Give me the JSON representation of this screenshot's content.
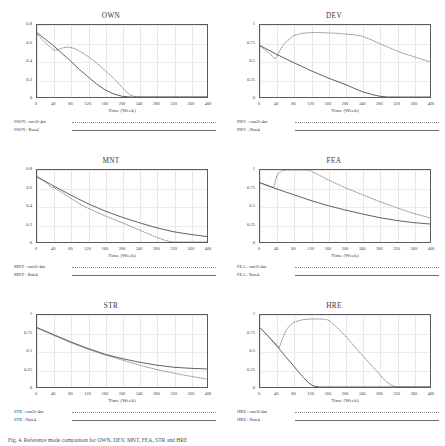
{
  "figure": {
    "caption": "Fig. 4. Reference mode comparison for OWN, DEV, MNT, FEA, STR and HRE",
    "xlabel": "Time (Week)",
    "xticks": [
      "0",
      "40",
      "80",
      "120",
      "160",
      "200",
      "240",
      "280",
      "320",
      "360",
      "400"
    ],
    "series_style": {
      "dotted_color": "#8a8a90",
      "solid_color": "#58585e",
      "frame_color": "#5a5a60",
      "grid_color": "#e9e6e3"
    }
  },
  "chart_data": [
    {
      "type": "line",
      "title": "OWN",
      "xlabel": "Time (Week)",
      "ylabel": "",
      "xlim": [
        0,
        400
      ],
      "ylim": [
        0,
        0.8
      ],
      "xticks": [
        0,
        40,
        80,
        120,
        160,
        200,
        240,
        280,
        320,
        360,
        400
      ],
      "yticks": [
        "0",
        "0.2",
        "0.4",
        "0.6",
        "0.8"
      ],
      "grid": true,
      "legend_position": "below",
      "series": [
        {
          "name": "OWN : run3f-4m",
          "style": "dotted",
          "x": [
            0,
            20,
            40,
            50,
            60,
            70,
            80,
            90,
            100,
            120,
            140,
            160,
            180,
            200,
            210,
            220,
            230,
            240,
            280,
            320,
            360,
            400
          ],
          "y": [
            0.7,
            0.6,
            0.52,
            0.525,
            0.545,
            0.555,
            0.55,
            0.535,
            0.51,
            0.45,
            0.38,
            0.295,
            0.21,
            0.11,
            0.06,
            0.02,
            0.005,
            0.0,
            0.0,
            0.0,
            0.0,
            0.0
          ]
        },
        {
          "name": "OWN : Run4",
          "style": "solid",
          "x": [
            0,
            20,
            40,
            60,
            80,
            100,
            120,
            140,
            160,
            180,
            200,
            220,
            240,
            280,
            320,
            360,
            400
          ],
          "y": [
            0.715,
            0.64,
            0.565,
            0.48,
            0.395,
            0.305,
            0.225,
            0.145,
            0.08,
            0.035,
            0.008,
            0.0,
            0.0,
            0.0,
            0.0,
            0.0,
            0.0
          ]
        }
      ]
    },
    {
      "type": "line",
      "title": "DEV",
      "xlabel": "Time (Week)",
      "ylabel": "",
      "xlim": [
        0,
        400
      ],
      "ylim": [
        0,
        1
      ],
      "xticks": [
        0,
        40,
        80,
        120,
        160,
        200,
        240,
        280,
        320,
        360,
        400
      ],
      "yticks": [
        "0",
        "0.25",
        "0.5",
        "0.75",
        "1"
      ],
      "grid": true,
      "legend_position": "below",
      "series": [
        {
          "name": "DEV : run3f-4m",
          "style": "dotted",
          "x": [
            0,
            20,
            35,
            40,
            50,
            60,
            80,
            100,
            120,
            140,
            160,
            180,
            200,
            220,
            240,
            260,
            280,
            300,
            320,
            340,
            360,
            380,
            400
          ],
          "y": [
            0.71,
            0.62,
            0.53,
            0.565,
            0.68,
            0.76,
            0.855,
            0.885,
            0.895,
            0.895,
            0.89,
            0.885,
            0.875,
            0.865,
            0.845,
            0.8,
            0.745,
            0.695,
            0.645,
            0.6,
            0.565,
            0.525,
            0.49
          ]
        },
        {
          "name": "DEV : Run4",
          "style": "solid",
          "x": [
            0,
            40,
            80,
            120,
            160,
            200,
            240,
            260,
            280,
            300,
            320,
            360,
            400
          ],
          "y": [
            0.715,
            0.59,
            0.475,
            0.365,
            0.265,
            0.175,
            0.075,
            0.04,
            0.012,
            0.0,
            0.0,
            0.0,
            0.0
          ]
        }
      ]
    },
    {
      "type": "line",
      "title": "MNT",
      "xlabel": "Time (Week)",
      "ylabel": "",
      "xlim": [
        0,
        400
      ],
      "ylim": [
        0,
        0.8
      ],
      "xticks": [
        0,
        40,
        80,
        120,
        160,
        200,
        240,
        280,
        320,
        360,
        400
      ],
      "yticks": [
        "0",
        "0.2",
        "0.4",
        "0.6",
        "0.8"
      ],
      "grid": true,
      "legend_position": "below",
      "series": [
        {
          "name": "MNT : run3f-4m",
          "style": "dotted",
          "x": [
            0,
            20,
            35,
            40,
            60,
            80,
            100,
            120,
            160,
            200,
            240,
            260,
            280,
            300,
            310,
            320,
            360,
            400
          ],
          "y": [
            0.725,
            0.665,
            0.605,
            0.605,
            0.545,
            0.485,
            0.425,
            0.375,
            0.29,
            0.215,
            0.135,
            0.095,
            0.055,
            0.02,
            0.008,
            0.0,
            0.0,
            0.0
          ]
        },
        {
          "name": "MNT : Run4",
          "style": "solid",
          "x": [
            0,
            40,
            80,
            120,
            160,
            200,
            240,
            280,
            320,
            360,
            400
          ],
          "y": [
            0.725,
            0.62,
            0.52,
            0.425,
            0.345,
            0.275,
            0.215,
            0.16,
            0.115,
            0.085,
            0.06
          ]
        }
      ]
    },
    {
      "type": "line",
      "title": "FEA",
      "xlabel": "Time (Week)",
      "ylabel": "",
      "xlim": [
        0,
        400
      ],
      "ylim": [
        0,
        1
      ],
      "xticks": [
        0,
        40,
        80,
        120,
        160,
        200,
        240,
        280,
        320,
        360,
        400
      ],
      "yticks": [
        "0",
        "0.25",
        "0.5",
        "0.75",
        "1"
      ],
      "grid": true,
      "legend_position": "below",
      "series": [
        {
          "name": "FEA : run3f-4m",
          "style": "dotted",
          "x": [
            0,
            20,
            32,
            40,
            50,
            60,
            80,
            100,
            110,
            120,
            140,
            160,
            200,
            240,
            280,
            320,
            360,
            400
          ],
          "y": [
            0.82,
            0.775,
            0.755,
            0.93,
            0.985,
            1.0,
            1.0,
            1.0,
            1.0,
            0.985,
            0.925,
            0.865,
            0.755,
            0.66,
            0.565,
            0.48,
            0.4,
            0.335
          ]
        },
        {
          "name": "FEA : Run4",
          "style": "solid",
          "x": [
            0,
            40,
            80,
            120,
            160,
            200,
            240,
            280,
            320,
            360,
            400
          ],
          "y": [
            0.825,
            0.735,
            0.655,
            0.575,
            0.505,
            0.445,
            0.39,
            0.34,
            0.3,
            0.27,
            0.25
          ]
        }
      ]
    },
    {
      "type": "line",
      "title": "STR",
      "xlabel": "Time (Week)",
      "ylabel": "",
      "xlim": [
        0,
        400
      ],
      "ylim": [
        0,
        1
      ],
      "xticks": [
        0,
        40,
        80,
        120,
        160,
        200,
        240,
        280,
        320,
        360,
        400
      ],
      "yticks": [
        "0",
        "0.25",
        "0.5",
        "0.75",
        "1"
      ],
      "grid": true,
      "legend_position": "below",
      "series": [
        {
          "name": "STR : run3f-4m",
          "style": "dotted",
          "x": [
            0,
            40,
            80,
            120,
            160,
            200,
            240,
            280,
            320,
            360,
            400
          ],
          "y": [
            0.82,
            0.715,
            0.615,
            0.525,
            0.445,
            0.375,
            0.305,
            0.245,
            0.195,
            0.15,
            0.11
          ]
        },
        {
          "name": "STR : Run4",
          "style": "solid",
          "x": [
            0,
            40,
            80,
            120,
            160,
            200,
            240,
            280,
            320,
            360,
            400
          ],
          "y": [
            0.825,
            0.725,
            0.625,
            0.535,
            0.455,
            0.395,
            0.345,
            0.305,
            0.275,
            0.26,
            0.25
          ]
        }
      ]
    },
    {
      "type": "line",
      "title": "HRE",
      "xlabel": "Time (Week)",
      "ylabel": "",
      "xlim": [
        0,
        400
      ],
      "ylim": [
        0,
        1
      ],
      "xticks": [
        0,
        40,
        80,
        120,
        160,
        200,
        240,
        280,
        320,
        360,
        400
      ],
      "yticks": [
        "0",
        "0.25",
        "0.5",
        "0.75",
        "1"
      ],
      "grid": true,
      "legend_position": "below",
      "series": [
        {
          "name": "HRE : run3f-4m",
          "style": "dotted",
          "x": [
            0,
            20,
            40,
            45,
            50,
            60,
            70,
            80,
            100,
            120,
            140,
            155,
            165,
            180,
            200,
            220,
            240,
            260,
            280,
            295,
            310,
            320,
            360,
            400
          ],
          "y": [
            0.82,
            0.7,
            0.585,
            0.545,
            0.625,
            0.775,
            0.855,
            0.9,
            0.935,
            0.945,
            0.945,
            0.94,
            0.915,
            0.835,
            0.715,
            0.58,
            0.445,
            0.315,
            0.185,
            0.085,
            0.02,
            0.005,
            0.0,
            0.0
          ]
        },
        {
          "name": "HRE : Run4",
          "style": "solid",
          "x": [
            0,
            20,
            40,
            60,
            80,
            100,
            115,
            125,
            140,
            160,
            200,
            240,
            280,
            320,
            360,
            400
          ],
          "y": [
            0.825,
            0.7,
            0.565,
            0.425,
            0.285,
            0.145,
            0.055,
            0.015,
            0.0,
            0.0,
            0.0,
            0.0,
            0.0,
            0.0,
            0.0,
            0.0
          ]
        }
      ]
    }
  ]
}
